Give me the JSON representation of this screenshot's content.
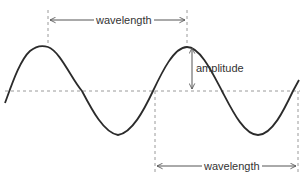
{
  "diagram": {
    "labels": {
      "wavelength_top": "wavelength",
      "amplitude": "amplitude",
      "wavelength_bottom": "wavelength"
    },
    "colors": {
      "wave": "#2b2b2b",
      "guide": "#9a9a9a",
      "arrow": "#555555",
      "text": "#333333"
    }
  }
}
